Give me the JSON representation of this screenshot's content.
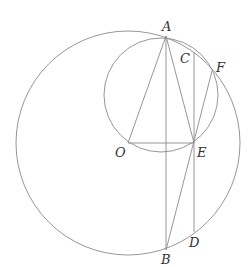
{
  "diagram": {
    "type": "geometry",
    "stroke_color": "#8a8a8a",
    "label_color": "#333333",
    "points": {
      "A": {
        "label": "A",
        "x": 166,
        "y": 36
      },
      "B": {
        "label": "B",
        "x": 166,
        "y": 250
      },
      "C": {
        "label": "C",
        "x": 194,
        "y": 52
      },
      "D": {
        "label": "D",
        "x": 194,
        "y": 232
      },
      "E": {
        "label": "E",
        "x": 194,
        "y": 143
      },
      "F": {
        "label": "F",
        "x": 212,
        "y": 71
      },
      "O": {
        "label": "O",
        "x": 128,
        "y": 143
      }
    },
    "circles": [
      {
        "name": "big-circle",
        "center": "O",
        "cx": 128,
        "cy": 143,
        "r": 112
      },
      {
        "name": "small-circle",
        "cx": 161,
        "cy": 95,
        "r": 57
      }
    ],
    "segments": [
      "OA",
      "AB",
      "AE",
      "OE",
      "CD",
      "EF",
      "EB"
    ]
  }
}
